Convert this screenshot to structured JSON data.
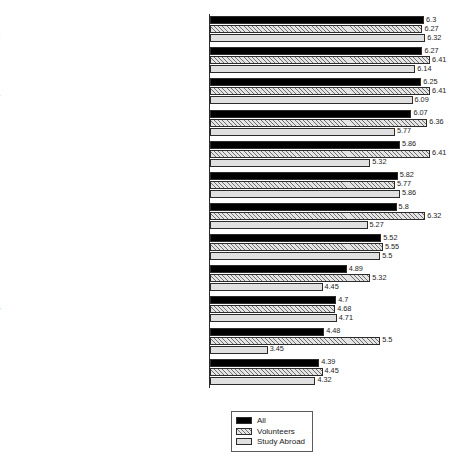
{
  "chart_data": {
    "type": "bar",
    "orientation": "horizontal",
    "title": "",
    "subtitle": "",
    "xlabel": "",
    "ylabel": "",
    "grid": false,
    "axis_ticks_visible": false,
    "xlim": [
      2.4,
      6.9
    ],
    "legend_position": "bottom-center",
    "categories": [
      "I have travelled more, or have plans to,\nas a result of my experiences with this trip",
      "I believe that the trip and my experiences\nabroad have changed my life",
      "My experiences abroad have become\na part of my identity",
      "I have a broadened\nmulticultural perspective",
      "I plan on volunteering or working while\ntravelling abroad in the future",
      "I have a better understanding of how the\nworld is becoming more globalized and westernized",
      "I am more aware of social issues",
      "I am more interested in learning other languages",
      "My perceptions about the value\nof money have changed",
      "I have a more optimistic world view",
      "My perception about standards\nof living have changed",
      "I read/watch international news more\noften to stay up-to-date on world issues"
    ],
    "series": [
      {
        "name": "All",
        "color": "#000000",
        "values": [
          6.3,
          6.27,
          6.25,
          6.07,
          5.86,
          5.82,
          5.8,
          5.52,
          4.89,
          4.7,
          4.48,
          4.39
        ],
        "labels": [
          "6.3",
          "6.27",
          "6.25",
          "6.07",
          "5.86",
          "5.82",
          "5.8",
          "5.52",
          "4.89",
          "4.7",
          "4.48",
          "4.39"
        ]
      },
      {
        "name": "Volunteers",
        "color": "#e4e4e4",
        "values": [
          6.27,
          6.41,
          6.41,
          6.36,
          6.41,
          5.77,
          6.32,
          5.55,
          5.32,
          4.68,
          5.5,
          4.45
        ],
        "labels": [
          "6.27",
          "6.41",
          "6.41",
          "6.36",
          "6.41",
          "5.77",
          "6.32",
          "5.55",
          "5.32",
          "4.68",
          "5.5",
          "4.45"
        ]
      },
      {
        "name": "Study Abroad",
        "color": "#e0e0e0",
        "values": [
          6.32,
          6.14,
          6.09,
          5.77,
          5.32,
          5.86,
          5.27,
          5.5,
          4.45,
          4.71,
          3.45,
          4.32
        ],
        "labels": [
          "6.32",
          "6.14",
          "6.09",
          "5.77",
          "5.32",
          "5.86",
          "5.27",
          "5.5",
          "4.45",
          "4.71",
          "3.45",
          "4.32"
        ]
      }
    ]
  },
  "legend": {
    "entries": [
      {
        "label": "All"
      },
      {
        "label": "Volunteers"
      },
      {
        "label": "Study Abroad"
      }
    ]
  }
}
